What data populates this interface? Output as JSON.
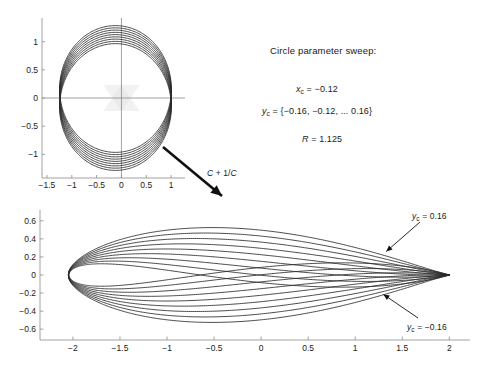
{
  "figure": {
    "title_block": {
      "heading": "Circle parameter sweep:",
      "eq_xc_var": "x",
      "eq_xc_sub": "c",
      "eq_xc_val": " = −0.12",
      "eq_yc_var": "y",
      "eq_yc_sub": "c",
      "eq_yc_val": " = {−0.16, −0.12, ... 0.16}",
      "eq_R_var": "R",
      "eq_R_val": " = 1.125"
    },
    "transform_arrow_label_a": "C",
    "transform_arrow_label_b": " + 1/",
    "transform_arrow_label_c": "C",
    "airfoil_label_top_var": "y",
    "airfoil_label_top_sub": "c",
    "airfoil_label_top_val": " = 0.16",
    "airfoil_label_bot_var": "y",
    "airfoil_label_bot_sub": "c",
    "airfoil_label_bot_val": " = −0.16",
    "colors": {
      "curve": "#2b2b2b",
      "axis": "#8c8c8c",
      "tick_text": "#1a1a1a",
      "arrow": "#111111",
      "faint_cross": "#c8c8c8"
    }
  },
  "chart_data": [
    {
      "type": "line",
      "name": "circle-parameter-sweep",
      "title": "",
      "xlabel": "",
      "ylabel": "",
      "xlim": [
        -1.6,
        1.28
      ],
      "ylim": [
        -1.42,
        1.42
      ],
      "xticks": [
        -1.5,
        -1,
        -0.5,
        0,
        0.5,
        1
      ],
      "xticklabels": [
        "−1.5",
        "−1",
        "−0.5",
        "0",
        "0.5",
        "1"
      ],
      "yticks": [
        -1,
        -0.5,
        0,
        0.5,
        1
      ],
      "yticklabels": [
        "−1",
        "−0.5",
        "0",
        "0.5",
        "1"
      ],
      "grid": false,
      "axes_style": "crosshair-through-origin",
      "series_description": "Family of circles of radius R centred at (xc, yc)",
      "R": 1.125,
      "xc": -0.12,
      "yc_values": [
        -0.16,
        -0.12,
        -0.08,
        -0.04,
        0,
        0.04,
        0.08,
        0.12,
        0.16
      ],
      "n_series": 9
    },
    {
      "type": "line",
      "name": "joukowski-airfoil-sweep",
      "title": "",
      "xlabel": "",
      "ylabel": "",
      "xlim": [
        -2.35,
        2.22
      ],
      "ylim": [
        -0.72,
        0.72
      ],
      "xticks": [
        -2,
        -1.5,
        -1,
        -0.5,
        0,
        0.5,
        1,
        1.5,
        2
      ],
      "xticklabels": [
        "−2",
        "−1.5",
        "−1",
        "−0.5",
        "0",
        "0.5",
        "1",
        "1.5",
        "2"
      ],
      "yticks": [
        -0.6,
        -0.4,
        -0.2,
        0,
        0.2,
        0.4,
        0.6
      ],
      "yticklabels": [
        "−0.6",
        "−0.4",
        "−0.2",
        "0",
        "0.2",
        "0.4",
        "0.6"
      ],
      "grid": false,
      "axes_style": "box-left-bottom",
      "series_description": "Joukowski map C + 1/C applied to each circle",
      "R": 1.125,
      "xc": -0.12,
      "yc_values": [
        -0.16,
        -0.12,
        -0.08,
        -0.04,
        0,
        0.04,
        0.08,
        0.12,
        0.16
      ],
      "n_series": 9,
      "annotations": [
        {
          "text": "yc = 0.16",
          "points_to": [
            1.33,
            0.26
          ]
        },
        {
          "text": "yc = -0.16",
          "points_to": [
            1.3,
            -0.215
          ]
        }
      ]
    }
  ]
}
